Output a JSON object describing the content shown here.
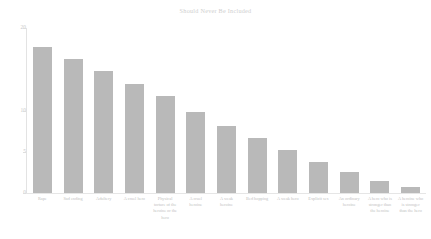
{
  "chart_data": {
    "type": "bar",
    "title": "Should Never Be Included",
    "xlabel": "",
    "ylabel": "",
    "ylim": [
      0,
      20
    ],
    "yticks": [
      0,
      5,
      10,
      20
    ],
    "ytick_labels": [
      "0",
      "5",
      "10",
      "20"
    ],
    "grid": false,
    "legend": false,
    "bar_color": "#b9b9b9",
    "categories": [
      "Rape",
      "Sad ending",
      "Adultery",
      "A cruel hero",
      "Physical torture of the heroine or the hero",
      "A cruel heroine",
      "A weak heroine",
      "Bed hopping",
      "A weak hero",
      "Explicit sex",
      "An ordinary heroine",
      "A hero who is stronger than the heroine",
      "A heroine who is stronger than the hero"
    ],
    "values": [
      17.7,
      16.2,
      14.8,
      13.2,
      11.8,
      9.8,
      8.1,
      6.7,
      5.2,
      3.8,
      2.5,
      1.5,
      0.7
    ]
  },
  "chart": {
    "title": "Should Never Be Included",
    "bottom_caption": ""
  }
}
